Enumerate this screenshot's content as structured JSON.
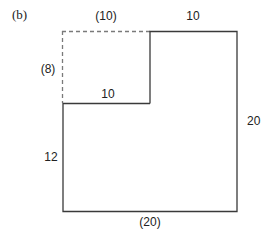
{
  "figure": {
    "panel_label": "(b)",
    "labels": {
      "top_left_dashed": "(10)",
      "top_right": "10",
      "left_dashed": "(8)",
      "inner_horizontal": "10",
      "right": "20",
      "left_lower": "12",
      "bottom": "(20)"
    },
    "colors": {
      "solid_line": "#3a3a3a",
      "dashed_line": "#7a7a7a"
    }
  }
}
